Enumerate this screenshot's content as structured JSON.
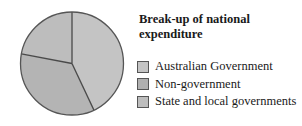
{
  "chart_data": {
    "type": "pie",
    "title": "Break-up of national expenditure",
    "categories": [
      "Australian Government",
      "Non-government",
      "State and local governments"
    ],
    "values": [
      43,
      35,
      22
    ],
    "unit": "%",
    "start_angle_deg": 0,
    "direction": "clockwise",
    "colors": [
      "#c4c4c4",
      "#b4b4b4",
      "#bdbdbd"
    ],
    "legend_position": "right"
  },
  "legend": {
    "items": [
      {
        "label": "Australian Government",
        "color": "#c4c4c4"
      },
      {
        "label": "Non-government",
        "color": "#b0b0b0"
      },
      {
        "label": "State and local governments",
        "color": "#bdbdbd"
      }
    ]
  }
}
